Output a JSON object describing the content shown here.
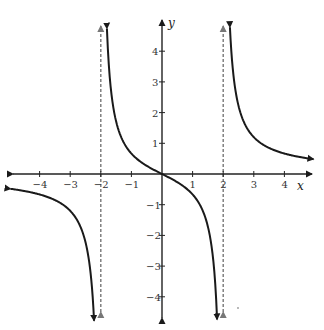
{
  "chart_data": {
    "type": "line",
    "title": "",
    "function": "f(x) = 2x / (x^2 - 4)",
    "xlabel": "x",
    "ylabel": "y",
    "xlim": [
      -4.7,
      4.7
    ],
    "ylim": [
      -4.5,
      4.7
    ],
    "grid": false,
    "legend": null,
    "x_ticks": [
      -4,
      -3,
      -2,
      -1,
      1,
      2,
      3,
      4
    ],
    "y_ticks": [
      -4,
      -3,
      -2,
      -1,
      1,
      2,
      3,
      4
    ],
    "x_tick_labels": [
      "−4",
      "−3",
      "−2",
      "−1",
      "1",
      "2",
      "3",
      "4"
    ],
    "y_tick_labels": [
      "−4",
      "−3",
      "−2",
      "−1",
      "1",
      "2",
      "3",
      "4"
    ],
    "vertical_asymptotes": [
      -2,
      2
    ],
    "horizontal_asymptote": 0,
    "series": [
      {
        "name": "left-branch",
        "x_range": [
          -4.95,
          -2.22
        ],
        "sample_points": [
          [
            -4.9,
            -0.98
          ],
          [
            -4,
            -0.67
          ],
          [
            -3,
            -1.2
          ],
          [
            -2.5,
            -2.22
          ],
          [
            -2.22,
            -4.8
          ]
        ]
      },
      {
        "name": "middle-branch",
        "x_range": [
          -1.8,
          1.8
        ],
        "sample_points": [
          [
            -1.8,
            4.74
          ],
          [
            -1.5,
            1.71
          ],
          [
            -1,
            0.67
          ],
          [
            0,
            0
          ],
          [
            1,
            -0.67
          ],
          [
            1.5,
            -1.71
          ],
          [
            1.8,
            -4.74
          ]
        ]
      },
      {
        "name": "right-branch",
        "x_range": [
          2.22,
          4.95
        ],
        "sample_points": [
          [
            2.22,
            4.8
          ],
          [
            2.5,
            2.22
          ],
          [
            3,
            1.2
          ],
          [
            4,
            0.67
          ],
          [
            4.9,
            0.98
          ]
        ]
      }
    ],
    "colors": {
      "curve": "#1a1a1a",
      "axes": "#222222",
      "asymptote": "#777777"
    }
  }
}
